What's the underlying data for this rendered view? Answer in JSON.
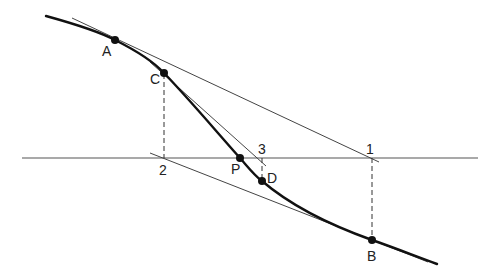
{
  "diagram": {
    "curve_points": {
      "A": "A",
      "C": "C",
      "P": "P",
      "D": "D",
      "B": "B"
    },
    "axis_points": {
      "one": "1",
      "two": "2",
      "three": "3"
    },
    "colors": {
      "curve": "#111111",
      "lines": "#444444",
      "background": "#ffffff"
    }
  }
}
